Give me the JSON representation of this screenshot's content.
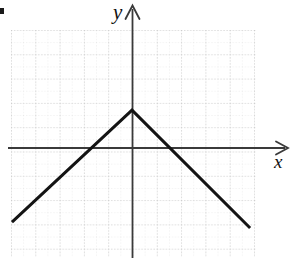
{
  "figure": {
    "kind": "cartesian-graph",
    "item_marker": "▪",
    "axes": {
      "x_label": "x",
      "y_label": "y",
      "x_arrow": "right",
      "y_arrow": "up",
      "axis_color": "#3a3a3a",
      "origin_px": {
        "x": 132,
        "y": 148
      }
    },
    "grid": {
      "visible": true,
      "style": "dotted",
      "color": "#c9c9c9",
      "minor_color": "#dcdcdc",
      "major_spacing_px": 24.3,
      "minor_per_major": 2,
      "left_px": 11,
      "top_px": 30,
      "right_px": 256,
      "bottom_px": 257
    },
    "curve": {
      "color": "#141414",
      "width_px": 3,
      "shape": "inverted-absolute-value"
    }
  },
  "chart_data": {
    "type": "line",
    "title": "",
    "xlabel": "x",
    "ylabel": "y",
    "grid": true,
    "legend": null,
    "xlim": [
      -5,
      5.1
    ],
    "ylim": [
      -4.5,
      4.85
    ],
    "xticks": [
      -5,
      -4,
      -3,
      -2,
      -1,
      0,
      1,
      2,
      3,
      4,
      5
    ],
    "yticks": [
      -4,
      -3,
      -2,
      -1,
      0,
      1,
      2,
      3,
      4
    ],
    "tick_labels_visible": false,
    "series": [
      {
        "name": "y = 1.5 - 0.93|x|",
        "x": [
          -4.94,
          0,
          4.86
        ],
        "y": [
          -3.05,
          1.56,
          -3.29
        ]
      }
    ],
    "annotations": [
      {
        "label": "vertex",
        "x": 0,
        "y": 1.56
      },
      {
        "label": "left x-intercept",
        "x": -1.65,
        "y": 0
      },
      {
        "label": "right x-intercept",
        "x": 1.65,
        "y": 0
      }
    ]
  }
}
